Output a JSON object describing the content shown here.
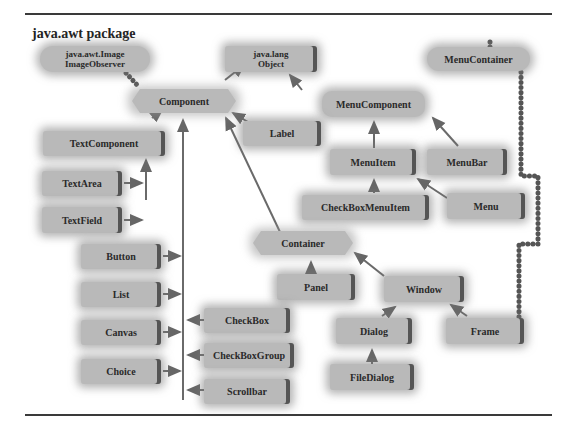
{
  "title": "java.awt package",
  "colors": {
    "node_fill": "#b9b9b9",
    "arrow": "#666666",
    "dotted": "#555555",
    "rule": "#3a3a3a"
  },
  "nodes": {
    "image_observer": "java.awt.Image\nImageObserver",
    "object": "java.lang\nObject",
    "menu_container": "MenuContainer",
    "component": "Component",
    "menu_component": "MenuComponent",
    "text_component": "TextComponent",
    "label": "Label",
    "menu_item": "MenuItem",
    "menu_bar": "MenuBar",
    "text_area": "TextArea",
    "text_field": "TextField",
    "checkbox_menu_item": "CheckBoxMenuItem",
    "menu": "Menu",
    "container": "Container",
    "button": "Button",
    "list": "List",
    "panel": "Panel",
    "window": "Window",
    "canvas": "Canvas",
    "checkbox": "CheckBox",
    "dialog": "Dialog",
    "frame": "Frame",
    "checkbox_group": "CheckBoxGroup",
    "choice": "Choice",
    "file_dialog": "FileDialog",
    "scrollbar": "Scrollbar"
  },
  "edges": [
    {
      "from": "Component",
      "to": "java.lang.Object",
      "type": "extends"
    },
    {
      "from": "Component",
      "to": "java.awt.Image.ImageObserver",
      "type": "implements"
    },
    {
      "from": "MenuComponent",
      "to": "java.lang.Object",
      "type": "extends"
    },
    {
      "from": "MenuBar",
      "to": "MenuContainer",
      "type": "implements"
    },
    {
      "from": "Menu",
      "to": "MenuContainer",
      "type": "implements"
    },
    {
      "from": "Frame",
      "to": "MenuContainer",
      "type": "implements"
    },
    {
      "from": "TextComponent",
      "to": "Component",
      "type": "extends"
    },
    {
      "from": "Label",
      "to": "Component",
      "type": "extends"
    },
    {
      "from": "Container",
      "to": "Component",
      "type": "extends"
    },
    {
      "from": "TextArea",
      "to": "TextComponent",
      "type": "extends"
    },
    {
      "from": "TextField",
      "to": "TextComponent",
      "type": "extends"
    },
    {
      "from": "Button",
      "to": "Component",
      "type": "extends"
    },
    {
      "from": "List",
      "to": "Component",
      "type": "extends"
    },
    {
      "from": "Canvas",
      "to": "Component",
      "type": "extends"
    },
    {
      "from": "Choice",
      "to": "Component",
      "type": "extends"
    },
    {
      "from": "CheckBox",
      "to": "Component",
      "type": "extends"
    },
    {
      "from": "CheckBoxGroup",
      "to": "Component",
      "type": "extends"
    },
    {
      "from": "Scrollbar",
      "to": "Component",
      "type": "extends"
    },
    {
      "from": "MenuItem",
      "to": "MenuComponent",
      "type": "extends"
    },
    {
      "from": "MenuBar",
      "to": "MenuComponent",
      "type": "extends"
    },
    {
      "from": "CheckBoxMenuItem",
      "to": "MenuItem",
      "type": "extends"
    },
    {
      "from": "Menu",
      "to": "MenuItem",
      "type": "extends"
    },
    {
      "from": "Panel",
      "to": "Container",
      "type": "extends"
    },
    {
      "from": "Window",
      "to": "Container",
      "type": "extends"
    },
    {
      "from": "Dialog",
      "to": "Window",
      "type": "extends"
    },
    {
      "from": "Frame",
      "to": "Window",
      "type": "extends"
    },
    {
      "from": "FileDialog",
      "to": "Dialog",
      "type": "extends"
    }
  ]
}
